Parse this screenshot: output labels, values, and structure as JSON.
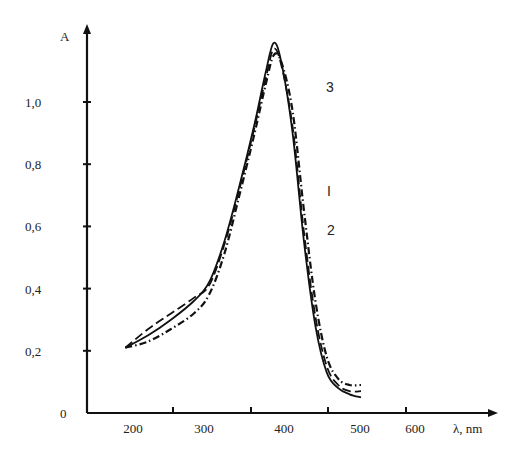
{
  "chart_data": {
    "type": "line",
    "title": "",
    "xlabel": "λ, nm",
    "ylabel": "A",
    "xlim": [
      180,
      680
    ],
    "ylim": [
      0,
      1.2
    ],
    "grid": false,
    "x_ticks": [
      200,
      300,
      400,
      500,
      600
    ],
    "x_tick_labels": [
      "200",
      "300",
      "400",
      "500",
      "600"
    ],
    "y_ticks": [
      0,
      0.2,
      0.4,
      0.6,
      0.8,
      1.0
    ],
    "y_tick_labels": [
      "0",
      "0,2",
      "0,4",
      "0,6",
      "0,8",
      "1,0"
    ],
    "series": [
      {
        "name": "I",
        "style": "solid",
        "x": [
          190,
          220,
          250,
          280,
          300,
          320,
          340,
          360,
          375,
          385,
          395,
          410,
          425,
          440,
          455,
          470,
          485,
          500
        ],
        "y": [
          0.21,
          0.25,
          0.3,
          0.36,
          0.42,
          0.55,
          0.73,
          0.93,
          1.1,
          1.19,
          1.13,
          0.9,
          0.55,
          0.28,
          0.13,
          0.08,
          0.06,
          0.05
        ]
      },
      {
        "name": "2",
        "style": "dashed",
        "x": [
          190,
          220,
          250,
          280,
          300,
          320,
          340,
          360,
          375,
          385,
          395,
          410,
          425,
          440,
          455,
          470,
          485,
          500
        ],
        "y": [
          0.21,
          0.27,
          0.32,
          0.37,
          0.41,
          0.54,
          0.72,
          0.92,
          1.08,
          1.17,
          1.12,
          0.92,
          0.58,
          0.31,
          0.15,
          0.09,
          0.07,
          0.07
        ]
      },
      {
        "name": "3",
        "style": "dash-dot",
        "x": [
          190,
          220,
          250,
          280,
          300,
          320,
          340,
          360,
          375,
          385,
          395,
          410,
          425,
          440,
          455,
          470,
          485,
          500
        ],
        "y": [
          0.21,
          0.23,
          0.27,
          0.32,
          0.38,
          0.51,
          0.7,
          0.9,
          1.06,
          1.15,
          1.13,
          0.97,
          0.65,
          0.36,
          0.18,
          0.11,
          0.09,
          0.09
        ]
      }
    ],
    "annotations": [
      {
        "text": "3",
        "series": "3"
      },
      {
        "text": "I",
        "series": "I"
      },
      {
        "text": "2",
        "series": "2"
      }
    ]
  }
}
